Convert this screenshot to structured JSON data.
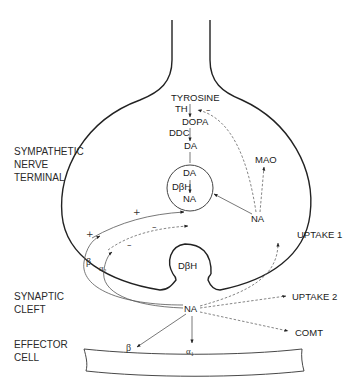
{
  "regions": {
    "terminal_line1": "SYMPATHETIC",
    "terminal_line2": "NERVE",
    "terminal_line3": "TERMINAL",
    "cleft_line1": "SYNAPTIC",
    "cleft_line2": "CLEFT",
    "effector_line1": "EFFECTOR",
    "effector_line2": "CELL"
  },
  "pathway": {
    "tyrosine": "TYROSINE",
    "th": "TH",
    "dopa": "DOPA",
    "ddc": "DDC",
    "da": "DA",
    "feedback_sign": "–"
  },
  "vesicle": {
    "da": "DA",
    "enzyme": "DβH",
    "na": "NA"
  },
  "cytoplasm": {
    "na": "NA",
    "mao": "MAO"
  },
  "release": {
    "enzyme": "DβH"
  },
  "receptors": {
    "beta_pre": "β",
    "alpha2": "α₂",
    "plus": "+",
    "minus": "–",
    "plus_arrow": "+",
    "minus_arrow": "–"
  },
  "cleft": {
    "na": "NA",
    "uptake1": "UPTAKE 1",
    "uptake2": "UPTAKE 2",
    "comt": "COMT"
  },
  "effector": {
    "beta": "β",
    "alpha1": "α₁"
  },
  "colors": {
    "line": "#222222",
    "dashed": "#666666",
    "background": "#ffffff"
  }
}
